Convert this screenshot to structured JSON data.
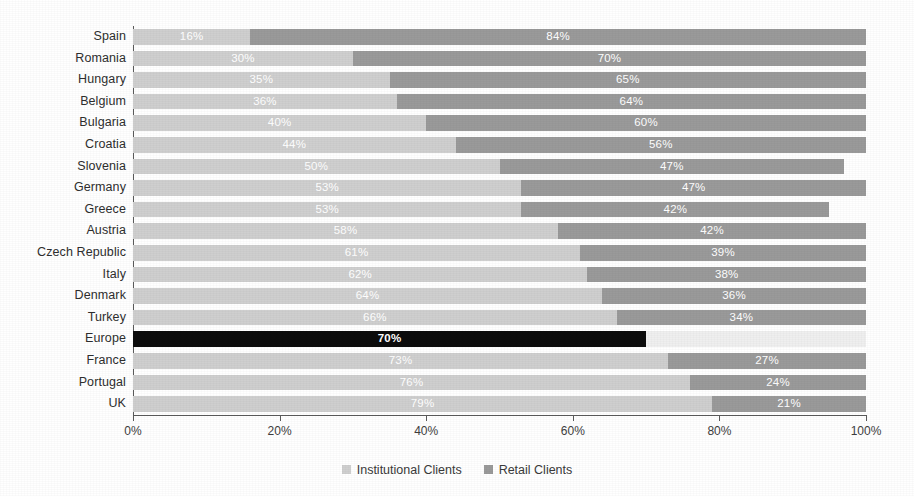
{
  "chart_data": {
    "type": "bar",
    "orientation": "horizontal",
    "stacked": true,
    "title": "",
    "xlabel": "",
    "ylabel": "",
    "xlim": [
      0,
      100
    ],
    "grid": false,
    "legend_position": "bottom-center",
    "categories": [
      "Spain",
      "Romania",
      "Hungary",
      "Belgium",
      "Bulgaria",
      "Croatia",
      "Slovenia",
      "Germany",
      "Greece",
      "Austria",
      "Czech Republic",
      "Italy",
      "Denmark",
      "Turkey",
      "Europe",
      "France",
      "Portugal",
      "UK"
    ],
    "series": [
      {
        "name": "Institutional Clients",
        "color": "#cfcfcf",
        "values": [
          16,
          30,
          35,
          36,
          40,
          44,
          50,
          53,
          53,
          58,
          61,
          62,
          64,
          66,
          70,
          73,
          76,
          79
        ]
      },
      {
        "name": "Retail Clients",
        "color": "#9a9a9a",
        "values": [
          84,
          70,
          65,
          64,
          60,
          56,
          47,
          47,
          42,
          42,
          39,
          38,
          36,
          34,
          30,
          27,
          24,
          21
        ]
      }
    ],
    "xticks": [
      0,
      20,
      40,
      60,
      80,
      100
    ],
    "xticklabels": [
      "0%",
      "20%",
      "40%",
      "60%",
      "80%",
      "100%"
    ],
    "highlight_category": "Europe",
    "highlight_color": "#0c0c0c"
  },
  "rows": [
    {
      "label": "Spain",
      "a": 16,
      "b": 84,
      "a_label": "16%",
      "b_label": "84%",
      "highlight": false
    },
    {
      "label": "Romania",
      "a": 30,
      "b": 70,
      "a_label": "30%",
      "b_label": "70%",
      "highlight": false
    },
    {
      "label": "Hungary",
      "a": 35,
      "b": 65,
      "a_label": "35%",
      "b_label": "65%",
      "highlight": false
    },
    {
      "label": "Belgium",
      "a": 36,
      "b": 64,
      "a_label": "36%",
      "b_label": "64%",
      "highlight": false
    },
    {
      "label": "Bulgaria",
      "a": 40,
      "b": 60,
      "a_label": "40%",
      "b_label": "60%",
      "highlight": false
    },
    {
      "label": "Croatia",
      "a": 44,
      "b": 56,
      "a_label": "44%",
      "b_label": "56%",
      "highlight": false
    },
    {
      "label": "Slovenia",
      "a": 50,
      "b": 47,
      "a_label": "50%",
      "b_label": "47%",
      "highlight": false
    },
    {
      "label": "Germany",
      "a": 53,
      "b": 47,
      "a_label": "53%",
      "b_label": "47%",
      "highlight": false
    },
    {
      "label": "Greece",
      "a": 53,
      "b": 42,
      "a_label": "53%",
      "b_label": "42%",
      "highlight": false
    },
    {
      "label": "Austria",
      "a": 58,
      "b": 42,
      "a_label": "58%",
      "b_label": "42%",
      "highlight": false
    },
    {
      "label": "Czech Republic",
      "a": 61,
      "b": 39,
      "a_label": "61%",
      "b_label": "39%",
      "highlight": false
    },
    {
      "label": "Italy",
      "a": 62,
      "b": 38,
      "a_label": "62%",
      "b_label": "38%",
      "highlight": false
    },
    {
      "label": "Denmark",
      "a": 64,
      "b": 36,
      "a_label": "64%",
      "b_label": "36%",
      "highlight": false
    },
    {
      "label": "Turkey",
      "a": 66,
      "b": 34,
      "a_label": "66%",
      "b_label": "34%",
      "highlight": false
    },
    {
      "label": "Europe",
      "a": 70,
      "b": 30,
      "a_label": "70%",
      "b_label": "",
      "highlight": true
    },
    {
      "label": "France",
      "a": 73,
      "b": 27,
      "a_label": "73%",
      "b_label": "27%",
      "highlight": false
    },
    {
      "label": "Portugal",
      "a": 76,
      "b": 24,
      "a_label": "76%",
      "b_label": "24%",
      "highlight": false
    },
    {
      "label": "UK",
      "a": 79,
      "b": 21,
      "a_label": "79%",
      "b_label": "21%",
      "highlight": false
    }
  ],
  "xaxis": {
    "ticks": [
      {
        "value": 0,
        "label": "0%"
      },
      {
        "value": 20,
        "label": "20%"
      },
      {
        "value": 40,
        "label": "40%"
      },
      {
        "value": 60,
        "label": "60%"
      },
      {
        "value": 80,
        "label": "80%"
      },
      {
        "value": 100,
        "label": "100%"
      }
    ]
  },
  "legend": {
    "items": [
      {
        "label": "Institutional Clients",
        "color": "#cfcfcf"
      },
      {
        "label": "Retail Clients",
        "color": "#9a9a9a"
      }
    ]
  }
}
